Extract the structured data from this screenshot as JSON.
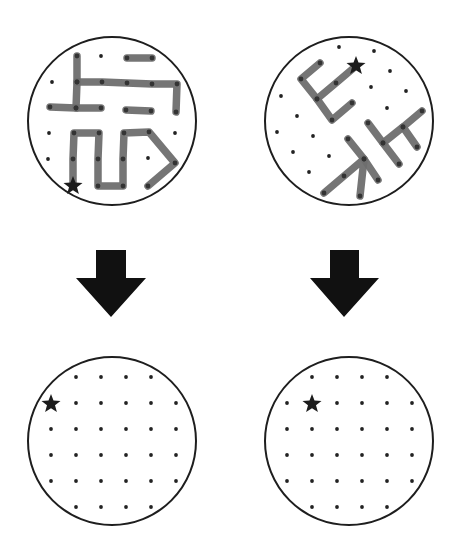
{
  "figure": {
    "colors": {
      "outline": "#1e1e1e",
      "dot": "#222222",
      "segment": "#6e6e6e",
      "segment_dot": "#333333",
      "star": "#1c1c1c",
      "arrow": "#111111"
    },
    "panels": [
      {
        "id": "top-left",
        "circle": {
          "cx": 112,
          "cy": 121,
          "r": 84
        },
        "star": {
          "x": 73,
          "y": 186
        },
        "dots": [
          [
            101,
            56
          ],
          [
            52,
            82
          ],
          [
            49,
            133
          ],
          [
            149,
            132
          ],
          [
            175,
            133
          ],
          [
            48,
            159
          ],
          [
            148,
            158
          ],
          [
            147,
            186
          ]
        ],
        "paths": [
          [
            [
              77,
              56
            ],
            [
              77,
              82
            ],
            [
              76,
              108
            ]
          ],
          [
            [
              50,
              107
            ],
            [
              76,
              108
            ],
            [
              101,
              108
            ]
          ],
          [
            [
              77,
              82
            ],
            [
              102,
              82
            ],
            [
              127,
              83
            ],
            [
              152,
              84
            ],
            [
              177,
              84
            ],
            [
              176,
              112
            ]
          ],
          [
            [
              127,
              58
            ],
            [
              152,
              58
            ]
          ],
          [
            [
              126,
              110
            ],
            [
              151,
              111
            ]
          ],
          [
            [
              73,
              186
            ],
            [
              73,
              159
            ],
            [
              74,
              133
            ],
            [
              99,
              133
            ],
            [
              98,
              159
            ],
            [
              98,
              186
            ],
            [
              123,
              186
            ],
            [
              123,
              159
            ],
            [
              124,
              133
            ],
            [
              149,
              132
            ],
            [
              175,
              163
            ],
            [
              148,
              186
            ]
          ]
        ]
      },
      {
        "id": "top-right",
        "circle": {
          "cx": 349,
          "cy": 121,
          "r": 84
        },
        "star": {
          "x": 356,
          "y": 66
        },
        "dots": [
          [
            339,
            47
          ],
          [
            374,
            51
          ],
          [
            390,
            71
          ],
          [
            371,
            87
          ],
          [
            406,
            91
          ],
          [
            387,
            108
          ],
          [
            281,
            96
          ],
          [
            297,
            116
          ],
          [
            277,
            132
          ],
          [
            313,
            136
          ],
          [
            293,
            152
          ],
          [
            329,
            156
          ],
          [
            309,
            172
          ]
        ],
        "paths": [
          [
            [
              320,
              63
            ],
            [
              301,
              79
            ],
            [
              317,
              99
            ],
            [
              332,
              120
            ],
            [
              352,
              103
            ]
          ],
          [
            [
              356,
              66
            ],
            [
              336,
              83
            ],
            [
              317,
              99
            ]
          ],
          [
            [
              348,
              139
            ],
            [
              364,
              159
            ],
            [
              378,
              180
            ]
          ],
          [
            [
              324,
              193
            ],
            [
              344,
              176
            ],
            [
              364,
              159
            ],
            [
              360,
              196
            ]
          ],
          [
            [
              368,
              123
            ],
            [
              383,
              143
            ],
            [
              399,
              164
            ]
          ],
          [
            [
              383,
              143
            ],
            [
              403,
              127
            ],
            [
              422,
              111
            ]
          ],
          [
            [
              403,
              127
            ],
            [
              417,
              147
            ]
          ]
        ]
      },
      {
        "id": "bottom-left",
        "circle": {
          "cx": 112,
          "cy": 441,
          "r": 84
        },
        "star": {
          "x": 51,
          "y": 404
        },
        "dots": [
          [
            76,
            377
          ],
          [
            101,
            377
          ],
          [
            126,
            377
          ],
          [
            151,
            377
          ],
          [
            76,
            403
          ],
          [
            101,
            403
          ],
          [
            126,
            403
          ],
          [
            151,
            403
          ],
          [
            176,
            403
          ],
          [
            51,
            429
          ],
          [
            76,
            429
          ],
          [
            101,
            429
          ],
          [
            126,
            429
          ],
          [
            151,
            429
          ],
          [
            176,
            429
          ],
          [
            51,
            455
          ],
          [
            76,
            455
          ],
          [
            101,
            455
          ],
          [
            126,
            455
          ],
          [
            151,
            455
          ],
          [
            176,
            455
          ],
          [
            51,
            481
          ],
          [
            76,
            481
          ],
          [
            101,
            481
          ],
          [
            126,
            481
          ],
          [
            151,
            481
          ],
          [
            176,
            481
          ],
          [
            76,
            507
          ],
          [
            101,
            507
          ],
          [
            126,
            507
          ],
          [
            151,
            507
          ]
        ],
        "paths": []
      },
      {
        "id": "bottom-right",
        "circle": {
          "cx": 349,
          "cy": 441,
          "r": 84
        },
        "star": {
          "x": 312,
          "y": 404
        },
        "dots": [
          [
            312,
            377
          ],
          [
            337,
            377
          ],
          [
            362,
            377
          ],
          [
            387,
            377
          ],
          [
            287,
            403
          ],
          [
            337,
            403
          ],
          [
            362,
            403
          ],
          [
            387,
            403
          ],
          [
            412,
            403
          ],
          [
            287,
            429
          ],
          [
            312,
            429
          ],
          [
            337,
            429
          ],
          [
            362,
            429
          ],
          [
            387,
            429
          ],
          [
            412,
            429
          ],
          [
            287,
            455
          ],
          [
            312,
            455
          ],
          [
            337,
            455
          ],
          [
            362,
            455
          ],
          [
            387,
            455
          ],
          [
            412,
            455
          ],
          [
            287,
            481
          ],
          [
            312,
            481
          ],
          [
            337,
            481
          ],
          [
            362,
            481
          ],
          [
            387,
            481
          ],
          [
            412,
            481
          ],
          [
            312,
            507
          ],
          [
            337,
            507
          ],
          [
            362,
            507
          ],
          [
            387,
            507
          ]
        ],
        "paths": []
      }
    ],
    "arrows": [
      {
        "id": "left-arrow",
        "shaft": {
          "x1": 96,
          "x2": 126,
          "top": 250
        },
        "head": {
          "y": 278,
          "x1": 76,
          "x2": 146,
          "tipx": 111,
          "tipy": 317
        }
      },
      {
        "id": "right-arrow",
        "shaft": {
          "x1": 330,
          "x2": 359,
          "top": 250
        },
        "head": {
          "y": 278,
          "x1": 310,
          "x2": 379,
          "tipx": 344,
          "tipy": 317
        }
      }
    ]
  }
}
